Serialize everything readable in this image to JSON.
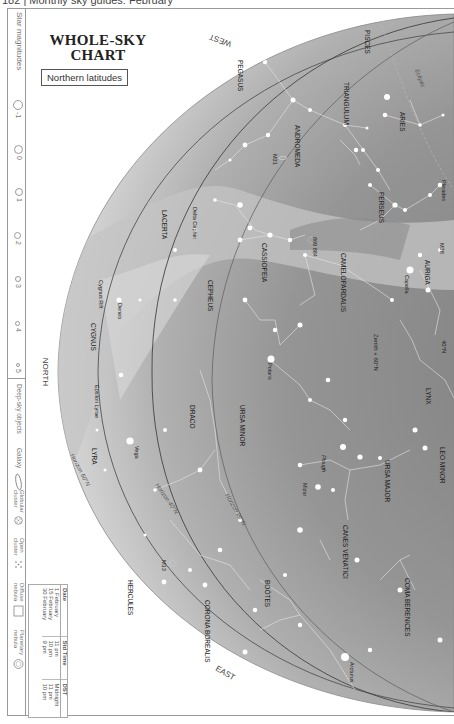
{
  "page_header": "182 | Monthly sky guides: February",
  "title": {
    "line1": "WHOLE-SKY",
    "line2": "CHART",
    "subtitle": "Northern latitudes"
  },
  "legend": {
    "magnitudes_label": "Star magnitudes",
    "magnitudes": [
      "-1",
      "0",
      "1",
      "2",
      "3",
      "4",
      "5"
    ],
    "deep_sky_label": "Deep-sky objects",
    "deep_sky": [
      {
        "label": "Galaxy",
        "icon": "galaxy-icon"
      },
      {
        "label": "Globular cluster",
        "icon": "globular-cluster-icon"
      },
      {
        "label": "Open cluster",
        "icon": "open-cluster-icon"
      },
      {
        "label": "Diffuse nebula",
        "icon": "diffuse-nebula-icon"
      },
      {
        "label": "Planetary nebula",
        "icon": "planetary-nebula-icon"
      }
    ]
  },
  "time_table": {
    "headers": [
      "Date",
      "Std Time",
      "DST"
    ],
    "rows": [
      [
        "1 February",
        "11 pm",
        "Midnight"
      ],
      [
        "15 February",
        "10 pm",
        "11 pm"
      ],
      [
        "30 February",
        "9 pm",
        "10 pm"
      ]
    ]
  },
  "directions": {
    "west": "WEST",
    "north": "NORTH",
    "east": "EAST"
  },
  "horizon_labels": {
    "h60": "Horizon 60°N",
    "h40": "Horizon 40°N",
    "h20": "Horizon 20°N",
    "zenith": "Zenith + 60°N",
    "lat40": "40°N",
    "ecliptic": "Ecliptic"
  },
  "constellations": [
    "PISCES",
    "PEGASUS",
    "TRIANGULUM",
    "ARIES",
    "ANDROMEDA",
    "PERSEUS",
    "LACERTA",
    "CASSIOPEIA",
    "CAMELOPARDALIS",
    "AURIGA",
    "CEPHEUS",
    "CYGNUS",
    "LYNX",
    "URSA MINOR",
    "DRACO",
    "URSA MAJOR",
    "LEO MINOR",
    "LYRA",
    "CANES VENATICI",
    "COMA BERENICES",
    "HERCULES",
    "BOÖTES",
    "CORONA BOREALIS"
  ],
  "stars": [
    "Capella",
    "Polaris",
    "Deneb",
    "Vega",
    "Mizar",
    "Arcturus",
    "Delta Cephei",
    "Epsilon Lyrae",
    "Pleiades"
  ],
  "objects": [
    "M31",
    "M38",
    "869 884",
    "M13",
    "Cygnus Rift",
    "Plough"
  ],
  "colors": {
    "sky_outer": "#c9c9c9",
    "sky_mid": "#a9a9a9",
    "sky_inner": "#8f8f8f",
    "milky_way": "#c4c4c4",
    "star": "#ffffff",
    "line": "#e8e8e8",
    "horizon_line": "#555555"
  }
}
